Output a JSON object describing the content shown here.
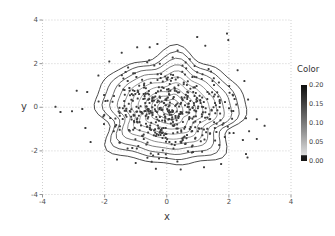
{
  "chart_data": {
    "type": "scatter",
    "subtype": "scatter-with-density-contours",
    "title": "",
    "xlabel": "x",
    "ylabel": "y",
    "xlim": [
      -4,
      4
    ],
    "ylim": [
      -4,
      4
    ],
    "x_ticks": [
      -4,
      -2,
      0,
      2,
      4
    ],
    "y_ticks": [
      -4,
      -2,
      0,
      2,
      4
    ],
    "x_tick_labels": [
      "-4",
      "-2",
      "0",
      "2",
      "4"
    ],
    "y_tick_labels": [
      "4",
      "2",
      "0",
      "-2",
      "-4"
    ],
    "grid": "dotted",
    "colors": {
      "grid": "#c3c3c3",
      "tick": "#8a8a8a",
      "point": "#3d3d3d",
      "text": "#4d4d4d"
    },
    "point_cloud": {
      "comment": "dense gaussian cloud of individual points, values estimated",
      "count": 500,
      "center": [
        0.08,
        -0.12
      ],
      "sigma": [
        1.02,
        1.08
      ],
      "clip_rx": 2.32,
      "clip_ry": 2.48,
      "seed": 11,
      "point_size_px": 2
    },
    "outlier_points": [
      [
        -3.58,
        0.02
      ],
      [
        -3.42,
        -0.22
      ],
      [
        -3.05,
        -0.18
      ],
      [
        -2.72,
        -0.08
      ],
      [
        -2.9,
        0.76
      ],
      [
        -2.56,
        0.7
      ],
      [
        -2.62,
        -0.95
      ],
      [
        -2.45,
        -1.6
      ],
      [
        -2.2,
        1.45
      ],
      [
        -1.85,
        2.1
      ],
      [
        -1.45,
        2.5
      ],
      [
        -0.95,
        2.75
      ],
      [
        -0.55,
        2.75
      ],
      [
        -0.3,
        2.9
      ],
      [
        0.35,
        2.6
      ],
      [
        0.98,
        3.22
      ],
      [
        1.94,
        3.38
      ],
      [
        1.98,
        3.08
      ],
      [
        1.24,
        2.82
      ],
      [
        2.28,
        1.7
      ],
      [
        2.5,
        1.2
      ],
      [
        2.62,
        0.35
      ],
      [
        2.55,
        -0.5
      ],
      [
        2.9,
        -0.55
      ],
      [
        3.15,
        -0.85
      ],
      [
        2.65,
        -1.1
      ],
      [
        2.45,
        -1.5
      ],
      [
        2.9,
        -1.45
      ],
      [
        2.55,
        -2.15
      ],
      [
        2.6,
        -2.3
      ],
      [
        1.75,
        -2.6
      ],
      [
        1.2,
        -2.75
      ],
      [
        0.45,
        -2.85
      ],
      [
        -0.35,
        -2.82
      ],
      [
        -1.0,
        -2.55
      ],
      [
        -1.6,
        -2.4
      ]
    ],
    "contours": {
      "center": [
        0.1,
        -0.1
      ],
      "x_squash": 0.97,
      "y_stretch": 1.07,
      "level_range": [
        0.0,
        0.2
      ],
      "rings": [
        {
          "r": 2.42,
          "color": "#383838",
          "h": [
            [
              5,
              0.07,
              0.5
            ],
            [
              8,
              0.05,
              2.1
            ],
            [
              11,
              0.03,
              4.0
            ]
          ]
        },
        {
          "r": 2.18,
          "color": "#454545",
          "h": [
            [
              5,
              0.065,
              0.65
            ],
            [
              8,
              0.048,
              2.3
            ],
            [
              11,
              0.028,
              4.2
            ]
          ]
        },
        {
          "r": 1.95,
          "color": "#585858",
          "h": [
            [
              5,
              0.06,
              0.8
            ],
            [
              8,
              0.045,
              2.5
            ],
            [
              11,
              0.026,
              4.4
            ]
          ]
        },
        {
          "r": 1.72,
          "color": "#6d6d6d",
          "h": [
            [
              5,
              0.058,
              0.95
            ],
            [
              8,
              0.042,
              2.7
            ],
            [
              11,
              0.024,
              4.6
            ]
          ]
        },
        {
          "r": 1.5,
          "color": "#818181",
          "h": [
            [
              5,
              0.055,
              1.1
            ],
            [
              8,
              0.04,
              2.9
            ],
            [
              11,
              0.022,
              4.8
            ]
          ]
        },
        {
          "r": 1.28,
          "color": "#8e8e8e",
          "h": [
            [
              5,
              0.052,
              1.25
            ],
            [
              8,
              0.038,
              3.1
            ],
            [
              11,
              0.02,
              5.0
            ]
          ]
        },
        {
          "r": 1.06,
          "color": "#919191",
          "h": [
            [
              5,
              0.05,
              1.4
            ],
            [
              8,
              0.036,
              3.3
            ],
            [
              11,
              0.018,
              5.2
            ]
          ]
        },
        {
          "r": 0.84,
          "color": "#898989",
          "h": [
            [
              5,
              0.048,
              1.55
            ],
            [
              8,
              0.034,
              3.5
            ],
            [
              11,
              0.016,
              5.4
            ]
          ]
        },
        {
          "r": 0.62,
          "color": "#7d7d7d",
          "h": [
            [
              5,
              0.046,
              1.7
            ],
            [
              8,
              0.032,
              3.7
            ],
            [
              11,
              0.014,
              5.6
            ]
          ]
        },
        {
          "r": 0.42,
          "color": "#6f6f6f",
          "h": [
            [
              5,
              0.044,
              1.85
            ],
            [
              8,
              0.03,
              3.9
            ],
            [
              11,
              0.012,
              5.8
            ]
          ]
        },
        {
          "r": 0.24,
          "color": "#616161",
          "h": [
            [
              5,
              0.042,
              2.0
            ],
            [
              8,
              0.028,
              4.1
            ],
            [
              11,
              0.01,
              6.0
            ]
          ]
        }
      ]
    }
  },
  "legend": {
    "title": "Color",
    "tick_labels": [
      "0.20",
      "0.15",
      "0.10",
      "0.05",
      "0.00"
    ],
    "gradient_stops": [
      [
        0.0,
        "#0e0e0e"
      ],
      [
        0.18,
        "#333333"
      ],
      [
        0.4,
        "#636363"
      ],
      [
        0.62,
        "#949494"
      ],
      [
        0.82,
        "#c6c6c6"
      ],
      [
        0.92,
        "#dedede"
      ],
      [
        0.93,
        "#1a1a1a"
      ],
      [
        1.0,
        "#161616"
      ]
    ]
  },
  "layout_px": {
    "plot": {
      "left": 42.5,
      "right": 291,
      "top": 20,
      "bottom": 194.5
    }
  }
}
